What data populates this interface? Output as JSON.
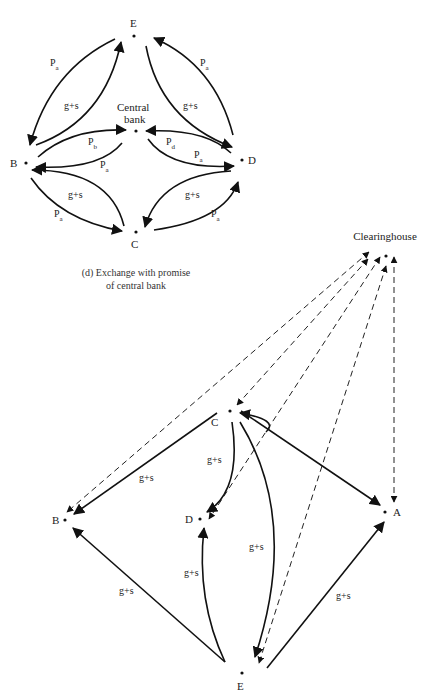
{
  "top_diagram": {
    "nodes": {
      "E": "E",
      "B": "B",
      "C": "C",
      "D": "D",
      "central_line1": "Central",
      "central_line2": "bank"
    },
    "edge_labels": {
      "pa_be": "P",
      "pa_be_sub": "a",
      "gs_be": "g+s",
      "pa_ed": "P",
      "pa_ed_sub": "a",
      "gs_ed": "g+s",
      "pb": "P",
      "pb_sub": "b",
      "pa_cb_b": "P",
      "pa_cb_b_sub": "a",
      "pd": "P",
      "pd_sub": "d",
      "pa_cb_d": "P",
      "pa_cb_d_sub": "a",
      "gs_bc": "g+s",
      "pa_bc": "P",
      "pa_bc_sub": "a",
      "gs_cd": "g+s",
      "pa_cd": "P",
      "pa_cd_sub": "a"
    },
    "caption_line1": "(d) Exchange with promise",
    "caption_line2": "of central bank"
  },
  "bottom_diagram": {
    "nodes": {
      "clearinghouse": "Clearinghouse",
      "C": "C",
      "B": "B",
      "D": "D",
      "A": "A",
      "E": "E"
    },
    "edge_labels": {
      "cb": "g+s",
      "cd": "g+s",
      "ce": "g+s",
      "eb": "g+s",
      "ed": "g+s",
      "ea": "g+s"
    }
  }
}
